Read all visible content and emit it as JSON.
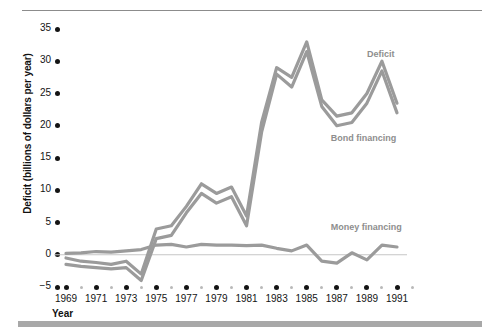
{
  "chart_data": {
    "type": "line",
    "title": "",
    "xlabel": "Year",
    "ylabel": "Deficit (billions of dollars per year)",
    "xlim": [
      1968,
      1992
    ],
    "ylim": [
      -5,
      35
    ],
    "yticks": [
      -5,
      0,
      5,
      10,
      15,
      20,
      25,
      30,
      35
    ],
    "ytick_labels": [
      "−5",
      "0",
      "5",
      "10",
      "15",
      "20",
      "25",
      "30",
      "35"
    ],
    "xticks": [
      1969,
      1971,
      1973,
      1975,
      1977,
      1979,
      1981,
      1983,
      1985,
      1987,
      1989,
      1991
    ],
    "xtick_labels": [
      "1969",
      "1971",
      "1973",
      "1975",
      "1977",
      "1979",
      "1981",
      "1983",
      "1985",
      "1987",
      "1989",
      "1991"
    ],
    "x_minor_ticks": [
      1968,
      1970,
      1972,
      1974,
      1976,
      1978,
      1980,
      1982,
      1984,
      1986,
      1988,
      1990,
      1992
    ],
    "grid": false,
    "legend_position": "inline-annotations",
    "zero_line": true,
    "line_color": "#9b9b9b",
    "x": [
      1969,
      1970,
      1971,
      1972,
      1973,
      1974,
      1975,
      1976,
      1977,
      1978,
      1979,
      1980,
      1981,
      1982,
      1983,
      1984,
      1985,
      1986,
      1987,
      1988,
      1989,
      1990,
      1991
    ],
    "series": [
      {
        "name": "Deficit",
        "label": "Deficit",
        "values": [
          -0.5,
          -1.0,
          -1.2,
          -1.5,
          -1.0,
          -3.0,
          4.0,
          4.5,
          7.5,
          11.0,
          9.5,
          10.5,
          6.0,
          20.5,
          29.0,
          27.5,
          33.0,
          24.0,
          21.5,
          22.0,
          25.0,
          30.0,
          23.5
        ]
      },
      {
        "name": "Bond financing",
        "label": "Bond financing",
        "values": [
          -1.5,
          -1.8,
          -2.0,
          -2.2,
          -2.0,
          -4.0,
          2.5,
          3.0,
          6.5,
          9.5,
          8.0,
          9.0,
          4.5,
          19.0,
          28.0,
          26.0,
          31.5,
          23.0,
          20.0,
          20.5,
          23.5,
          28.5,
          22.0
        ]
      },
      {
        "name": "Money financing",
        "label": "Money financing",
        "values": [
          0.2,
          0.3,
          0.5,
          0.4,
          0.6,
          0.8,
          1.5,
          1.6,
          1.2,
          1.6,
          1.5,
          1.5,
          1.4,
          1.5,
          1.0,
          0.6,
          1.5,
          -1.0,
          -1.3,
          0.3,
          -0.8,
          1.5,
          1.2
        ]
      }
    ],
    "annotations": [
      {
        "text": "Deficit",
        "x": 1989.0,
        "y": 31.0
      },
      {
        "text": "Bond financing",
        "x": 1986.6,
        "y": 18.0
      },
      {
        "text": "Money financing",
        "x": 1986.6,
        "y": 4.2
      }
    ]
  }
}
